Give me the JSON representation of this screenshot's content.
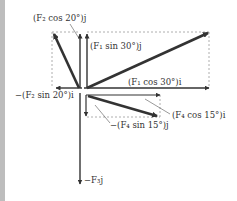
{
  "diagram": {
    "labels": {
      "f2_cos": "(F₂ cos 20°)j",
      "f1_sin": "(F₁ sin 30°)j",
      "f1_cos": "(F₁ cos 30°)i",
      "f2_sin": "−(F₂ sin 20°)i",
      "f4_cos": "(F₄ cos 15°)i",
      "f4_sin": "−(F₄ sin 15°)j",
      "f3": "−F₃j"
    },
    "vectors": [
      {
        "name": "F1",
        "angle_deg": 30,
        "quadrant": "upper-right"
      },
      {
        "name": "F2",
        "angle_deg": 20,
        "from_axis": "vertical",
        "quadrant": "upper-left"
      },
      {
        "name": "F3",
        "direction": "down"
      },
      {
        "name": "F4",
        "angle_deg": -15,
        "quadrant": "lower-right"
      }
    ],
    "colors": {
      "vector": "#333333",
      "dashed": "#9a9a9a",
      "sidebar": "#bdbdbd"
    }
  }
}
